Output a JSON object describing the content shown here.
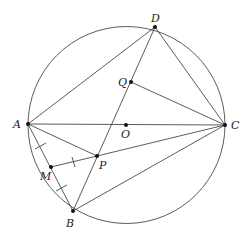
{
  "diagram": {
    "type": "geometry",
    "labels": {
      "A": "A",
      "B": "B",
      "C": "C",
      "D": "D",
      "O": "O",
      "P": "P",
      "Q": "Q",
      "M": "M"
    },
    "segments": [
      "AD",
      "DC",
      "AC",
      "AB",
      "BC",
      "BD",
      "AP",
      "PC",
      "MP",
      "QC"
    ],
    "equal_marks": [
      "AM",
      "MB",
      "MP"
    ],
    "colors": {
      "stroke": "#4a4a4a",
      "point": "#111111",
      "background": "#ffffff"
    }
  }
}
